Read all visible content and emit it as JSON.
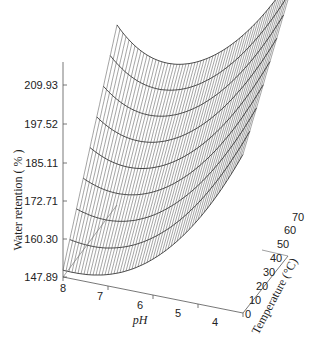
{
  "chart_data": {
    "type": "surface3d",
    "title": "",
    "xlabel": "pH",
    "ylabel": "Temperature (°C)",
    "zlabel": "Water retention ( % )",
    "x_ticks": [
      "8",
      "7",
      "6",
      "5",
      "4"
    ],
    "y_ticks": [
      "0",
      "10",
      "20",
      "30",
      "40",
      "50",
      "60",
      "70"
    ],
    "z_ticks": [
      "147.89",
      "160.30",
      "172.71",
      "185.11",
      "197.52",
      "209.93"
    ],
    "x_range": [
      4,
      8
    ],
    "y_range": [
      0,
      70
    ],
    "z_range": [
      147.89,
      209.93
    ],
    "grid": false,
    "legend": null,
    "surface_description": "Wireframe mesh; water retention increases steeply as pH decreases toward 4 and as temperature increases. Minimum near pH 8, T 0.",
    "sample_points": [
      {
        "pH": 8,
        "T": 0,
        "retention": 147.89
      },
      {
        "pH": 8,
        "T": 70,
        "retention": 197.52
      },
      {
        "pH": 4,
        "T": 0,
        "retention": 160.3
      },
      {
        "pH": 4,
        "T": 70,
        "retention": 209.93
      }
    ]
  },
  "axes": {
    "z_title": "Water retention ( % )",
    "x_title": "pH",
    "y_title": "Temperature (°C)",
    "z_ticks": [
      {
        "label": "209.93",
        "y": 85
      },
      {
        "label": "197.52",
        "y": 124
      },
      {
        "label": "185.11",
        "y": 163
      },
      {
        "label": "172.71",
        "y": 201
      },
      {
        "label": "160.30",
        "y": 239
      },
      {
        "label": "147.89",
        "y": 277
      }
    ],
    "x_ticks": [
      {
        "label": "8",
        "x": 63,
        "y": 292
      },
      {
        "label": "7",
        "x": 100,
        "y": 300
      },
      {
        "label": "6",
        "x": 140,
        "y": 309
      },
      {
        "label": "5",
        "x": 178,
        "y": 317
      },
      {
        "label": "4",
        "x": 215,
        "y": 326
      }
    ],
    "y_ticks": [
      {
        "label": "0",
        "x": 245,
        "y": 318
      },
      {
        "label": "10",
        "x": 249,
        "y": 304
      },
      {
        "label": "20",
        "x": 256,
        "y": 290
      },
      {
        "label": "30",
        "x": 263,
        "y": 276
      },
      {
        "label": "40",
        "x": 270,
        "y": 262
      },
      {
        "label": "50",
        "x": 277,
        "y": 248
      },
      {
        "label": "60",
        "x": 284,
        "y": 234
      },
      {
        "label": "70",
        "x": 292,
        "y": 221
      }
    ]
  }
}
